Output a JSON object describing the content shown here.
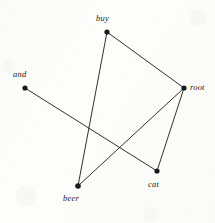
{
  "figure": {
    "type": "node-link-diagram",
    "background_color": "#fdfdfc",
    "ink_color": "#1a1a1a",
    "width": 215,
    "height": 223
  },
  "graph": {
    "nodes": [
      {
        "id": "buy",
        "label": "buy",
        "x": 107,
        "y": 32,
        "label_x": 96,
        "label_y": 14,
        "radius": 2.6
      },
      {
        "id": "root",
        "label": "root",
        "x": 184,
        "y": 88,
        "label_x": 190,
        "label_y": 83,
        "radius": 2.6
      },
      {
        "id": "and",
        "label": "and",
        "x": 25,
        "y": 88,
        "label_x": 13,
        "label_y": 70,
        "radius": 2.6
      },
      {
        "id": "beer",
        "label": "beer",
        "x": 78,
        "y": 186,
        "label_x": 63,
        "label_y": 194,
        "radius": 2.8
      },
      {
        "id": "cat",
        "label": "cat",
        "x": 157,
        "y": 171,
        "label_x": 148,
        "label_y": 180,
        "radius": 2.6
      }
    ],
    "edges": [
      {
        "source": "buy",
        "target": "root"
      },
      {
        "source": "buy",
        "target": "beer"
      },
      {
        "source": "root",
        "target": "beer"
      },
      {
        "source": "root",
        "target": "cat"
      },
      {
        "source": "and",
        "target": "cat"
      }
    ],
    "edge_width": 0.9
  }
}
